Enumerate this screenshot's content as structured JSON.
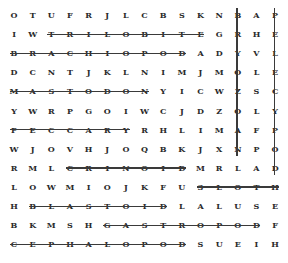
{
  "puzzle": {
    "rows": [
      "OTUFRJLCBSKNBAP",
      "IWTRILOBITEGRHE",
      "BRACHIOPODADYVL",
      "DCNTJKLNIMJMOLE",
      "MASTODONYICWZSC",
      "YWRPGOIWCJDZOLY",
      "PECCARYRHLIMAFP",
      "WJOVHJOQBKJXNPO",
      "RMLCRINOIDMRLAD",
      "LOWMIOJKFUSLOTH",
      "HBLASTOIDLALUSE",
      "BKMSHGASTROPODF",
      "CEPHALOPODSUEIH"
    ],
    "found_words": [
      {
        "word": "TRILOBITE",
        "row": 1,
        "col_start": 2,
        "col_end": 10,
        "direction": "horizontal"
      },
      {
        "word": "BRACHIOPOD",
        "row": 2,
        "col_start": 0,
        "col_end": 9,
        "direction": "horizontal"
      },
      {
        "word": "MASTODON",
        "row": 4,
        "col_start": 0,
        "col_end": 7,
        "direction": "horizontal"
      },
      {
        "word": "PECCARY",
        "row": 6,
        "col_start": 0,
        "col_end": 6,
        "direction": "horizontal"
      },
      {
        "word": "CRINOID",
        "row": 8,
        "col_start": 3,
        "col_end": 9,
        "direction": "horizontal"
      },
      {
        "word": "SLOTH",
        "row": 9,
        "col_start": 10,
        "col_end": 14,
        "direction": "horizontal"
      },
      {
        "word": "BLASTOID",
        "row": 10,
        "col_start": 1,
        "col_end": 8,
        "direction": "horizontal"
      },
      {
        "word": "GASTROPOD",
        "row": 11,
        "col_start": 5,
        "col_end": 13,
        "direction": "horizontal"
      },
      {
        "word": "CEPHALOPOD",
        "row": 12,
        "col_start": 0,
        "col_end": 9,
        "direction": "horizontal"
      },
      {
        "word": "BRYOZOAN",
        "col": 12,
        "row_start": 0,
        "row_end": 7,
        "direction": "vertical"
      },
      {
        "word": "PELECYPOD",
        "col": 14,
        "row_start": 0,
        "row_end": 8,
        "direction": "vertical"
      }
    ],
    "line_color": "#3a3a3a",
    "letter_color": "#2a2a2a"
  }
}
